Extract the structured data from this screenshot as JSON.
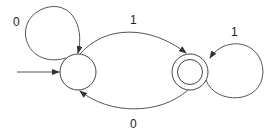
{
  "diagram": {
    "type": "finite-automaton",
    "states": [
      {
        "id": "q0",
        "start": true,
        "accepting": false
      },
      {
        "id": "q1",
        "start": false,
        "accepting": true
      }
    ],
    "transitions": [
      {
        "from": "q0",
        "to": "q0",
        "label": "0"
      },
      {
        "from": "q0",
        "to": "q1",
        "label": "1"
      },
      {
        "from": "q1",
        "to": "q1",
        "label": "1"
      },
      {
        "from": "q1",
        "to": "q0",
        "label": "0"
      }
    ]
  },
  "labels": {
    "loop_q0": "0",
    "edge_q0_q1": "1",
    "loop_q1": "1",
    "edge_q1_q0": "0"
  }
}
